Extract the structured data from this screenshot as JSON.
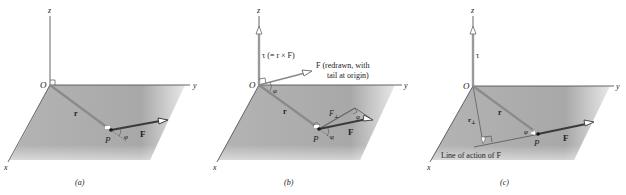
{
  "figure": {
    "panels": [
      {
        "id": "a",
        "caption": "(a)",
        "axes": {
          "x": "x",
          "y": "y",
          "z": "z"
        },
        "origin_label": "O",
        "point_label": "P",
        "vectors": {
          "r": "r",
          "F": "F"
        },
        "angle_label": "φ"
      },
      {
        "id": "b",
        "caption": "(b)",
        "axes": {
          "x": "x",
          "y": "y",
          "z": "z"
        },
        "origin_label": "O",
        "point_label": "P",
        "vectors": {
          "r": "r",
          "F": "F",
          "tau": "τ (= r × F)",
          "F_perp": "F",
          "F_perp_sub": "⊥"
        },
        "redrawn_label_line1": "F (redrawn, with",
        "redrawn_label_line2": "tail at origin)",
        "angle_label": "φ"
      },
      {
        "id": "c",
        "caption": "(c)",
        "axes": {
          "x": "x",
          "y": "y",
          "z": "z"
        },
        "origin_label": "O",
        "point_label": "P",
        "vectors": {
          "r": "r",
          "F": "F",
          "tau": "τ",
          "r_perp": "r",
          "r_perp_sub": "⊥"
        },
        "line_of_action_label": "Line of action of F",
        "angle_label": "φ"
      }
    ],
    "colors": {
      "plane": "#a9a9a9",
      "axis": "#555555",
      "vector": "#3a3a3a",
      "r_vector": "#8a8a8a",
      "tau_vector": "#9a9a9a"
    }
  }
}
